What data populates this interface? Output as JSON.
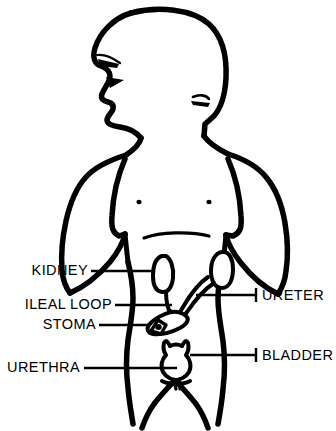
{
  "diagram": {
    "stroke_color": "#000000",
    "background_color": "#ffffff",
    "labels": [
      {
        "id": "kidney",
        "text": "KIDNEY",
        "side": "left",
        "x": 88,
        "y": 275
      },
      {
        "id": "ileal-loop",
        "text": "ILEAL  LOOP",
        "side": "left",
        "x": 112,
        "y": 309
      },
      {
        "id": "stoma",
        "text": "STOMA",
        "side": "left",
        "x": 96,
        "y": 329
      },
      {
        "id": "urethra",
        "text": "URETHRA",
        "side": "left",
        "x": 80,
        "y": 372
      },
      {
        "id": "ureter",
        "text": "URETER",
        "side": "right",
        "x": 259,
        "y": 299
      },
      {
        "id": "bladder",
        "text": "BLADDER",
        "side": "right",
        "x": 259,
        "y": 359
      }
    ],
    "organs": [
      {
        "id": "left-kidney",
        "name": "kidney"
      },
      {
        "id": "right-kidney",
        "name": "kidney"
      },
      {
        "id": "left-ureter",
        "name": "ureter"
      },
      {
        "id": "right-ureter",
        "name": "ureter"
      },
      {
        "id": "ileal-conduit",
        "name": "ileal loop conduit"
      },
      {
        "id": "stoma-marker",
        "name": "stoma"
      },
      {
        "id": "bladder-organ",
        "name": "bladder"
      },
      {
        "id": "urethra-tube",
        "name": "urethra"
      }
    ]
  }
}
